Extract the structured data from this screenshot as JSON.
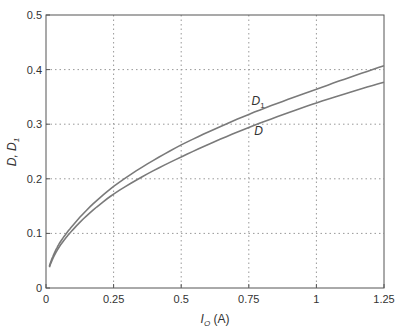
{
  "chart_data": {
    "type": "line",
    "title": "",
    "xlabel": "I_O (A)",
    "ylabel": "D, D_1",
    "xlim": [
      0,
      1.25
    ],
    "ylim": [
      0,
      0.5
    ],
    "xticks": [
      0,
      0.25,
      0.5,
      0.75,
      1,
      1.25
    ],
    "xtick_labels": [
      "0",
      "0.25",
      "0.5",
      "0.75",
      "1",
      "1.25"
    ],
    "yticks": [
      0,
      0.1,
      0.2,
      0.3,
      0.4,
      0.5
    ],
    "ytick_labels": [
      "0",
      "0.1",
      "0.2",
      "0.3",
      "0.4",
      "0.5"
    ],
    "grid": true,
    "legend": "none (inline curve labels)",
    "x": [
      0.0125,
      0.05,
      0.1,
      0.25,
      0.5,
      0.75,
      1.0,
      1.25
    ],
    "series": [
      {
        "name": "D_1",
        "label_text": "D",
        "label_sub": "1",
        "label_pos": [
          0.76,
          0.335
        ],
        "color": "#7a7a7a",
        "values": [
          0.04,
          0.082,
          0.115,
          0.186,
          0.262,
          0.318,
          0.364,
          0.407
        ]
      },
      {
        "name": "D",
        "label_text": "D",
        "label_sub": "",
        "label_pos": [
          0.77,
          0.28
        ],
        "color": "#7a7a7a",
        "values": [
          0.038,
          0.076,
          0.107,
          0.172,
          0.24,
          0.294,
          0.339,
          0.377
        ]
      }
    ]
  },
  "axis": {
    "xlabel_main": "I",
    "xlabel_sub": "O",
    "xlabel_unit": " (A)",
    "ylabel_text": "D, D",
    "ylabel_sub": "1"
  }
}
